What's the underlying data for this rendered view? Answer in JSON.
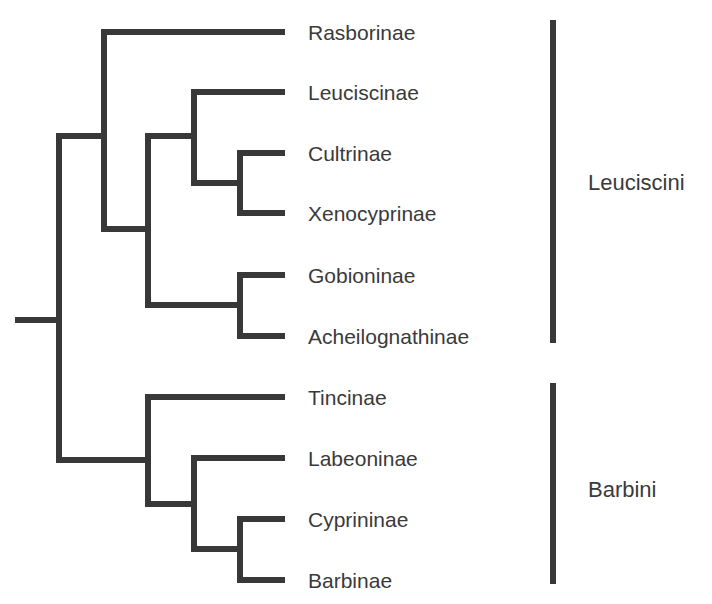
{
  "diagram": {
    "type": "cladogram",
    "line_color": "#383838",
    "text_color": "#3a3a3a",
    "taxa": [
      {
        "name": "Rasborinae",
        "y": 32
      },
      {
        "name": "Leuciscinae",
        "y": 92
      },
      {
        "name": "Cultrinae",
        "y": 153
      },
      {
        "name": "Xenocyprinae",
        "y": 213
      },
      {
        "name": "Gobioninae",
        "y": 275
      },
      {
        "name": "Acheilognathinae",
        "y": 336
      },
      {
        "name": "Tincinae",
        "y": 397
      },
      {
        "name": "Labeoninae",
        "y": 458
      },
      {
        "name": "Cyprininae",
        "y": 519
      },
      {
        "name": "Barbinae",
        "y": 580
      }
    ],
    "groups": [
      {
        "name": "Leuciscini",
        "members": [
          "Rasborinae",
          "Leuciscinae",
          "Cultrinae",
          "Xenocyprinae",
          "Gobioninae",
          "Acheilognathinae"
        ],
        "bar_top": 20,
        "bar_bottom": 343,
        "label_y": 183
      },
      {
        "name": "Barbini",
        "members": [
          "Tincinae",
          "Labeoninae",
          "Cyprininae",
          "Barbinae"
        ],
        "bar_top": 383,
        "bar_bottom": 584,
        "label_y": 490
      }
    ],
    "topology": "((Rasborinae,((Leuciscinae,(Cultrinae,Xenocyprinae)),(Gobioninae,Acheilognathinae))),(Tincinae,(Labeoninae,(Cyprininae,Barbinae))))"
  }
}
